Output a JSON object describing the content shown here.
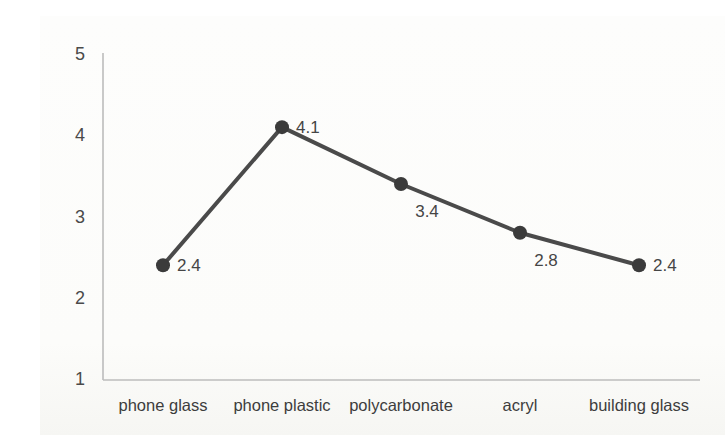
{
  "chart_data": {
    "type": "line",
    "title": "",
    "xlabel": "",
    "ylabel": "",
    "categories": [
      "phone glass",
      "phone plastic",
      "polycarbonate",
      "acryl",
      "building glass"
    ],
    "series": [
      {
        "name": "series-1",
        "values": [
          2.4,
          4.1,
          3.4,
          2.8,
          2.4
        ],
        "data_labels": [
          "2.4",
          "4.1",
          "3.4",
          "2.8",
          "2.4"
        ],
        "label_placement": [
          "right",
          "right",
          "below",
          "below",
          "right"
        ]
      }
    ],
    "ylim": [
      1,
      5
    ],
    "yticks": [
      5,
      4,
      3,
      2,
      1
    ],
    "grid": false,
    "legend": false,
    "marker": "circle",
    "colors": {
      "line": "#4a4a4a",
      "marker": "#3b3b3b",
      "axis": "#bcbcbc",
      "tick_text": "#4a4a4a",
      "category_text": "#3d3d3d",
      "data_label_text": "#454545",
      "background": "#fcfcfa"
    }
  }
}
